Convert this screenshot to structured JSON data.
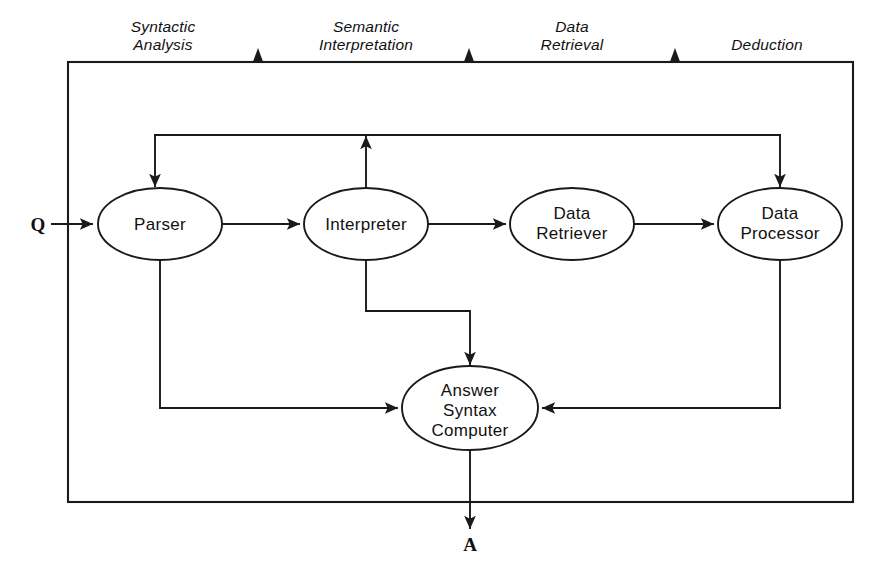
{
  "diagram": {
    "background_color": "#ffffff",
    "line_color": "#1a1a1a",
    "stage_labels": [
      {
        "id": "syntactic-analysis",
        "line1": "Syntactic",
        "line2": "Analysis",
        "x": 163,
        "label_y": 30
      },
      {
        "id": "semantic-interpretation",
        "line1": "Semantic",
        "line2": "Interpretation",
        "x": 366,
        "label_y": 30
      },
      {
        "id": "data-retrieval",
        "line1": "Data",
        "line2": "Retrieval",
        "x": 572,
        "label_y": 30
      },
      {
        "id": "deduction",
        "line1": "Deduction",
        "line2": "",
        "x": 765,
        "label_y": 48
      }
    ],
    "stage_dividers": [
      {
        "id": "divider-1",
        "x": 258
      },
      {
        "id": "divider-2",
        "x": 469
      },
      {
        "id": "divider-3",
        "x": 675
      }
    ],
    "nodes": [
      {
        "id": "parser",
        "lines": [
          "Parser"
        ],
        "cx": 160,
        "cy": 224,
        "rx": 62,
        "ry": 36
      },
      {
        "id": "interpreter",
        "lines": [
          "Interpreter"
        ],
        "cx": 366,
        "cy": 224,
        "rx": 62,
        "ry": 36
      },
      {
        "id": "data-retriever",
        "lines": [
          "Data",
          "Retriever"
        ],
        "cx": 572,
        "cy": 224,
        "rx": 62,
        "ry": 36
      },
      {
        "id": "data-processor",
        "lines": [
          "Data",
          "Processor"
        ],
        "cx": 780,
        "cy": 224,
        "rx": 62,
        "ry": 36
      },
      {
        "id": "answer-syntax-computer",
        "lines": [
          "Answer",
          "Syntax",
          "Computer"
        ],
        "cx": 470,
        "cy": 408,
        "rx": 68,
        "ry": 42
      }
    ],
    "io_labels": [
      {
        "id": "question-input",
        "text": "Q",
        "x": 38,
        "y": 230
      },
      {
        "id": "answer-output",
        "text": "A",
        "x": 470,
        "y": 548
      }
    ],
    "frame": {
      "x": 68,
      "y": 62,
      "width": 785,
      "height": 440
    },
    "edges": [
      {
        "id": "q-to-parser",
        "from": "Q",
        "to": "parser"
      },
      {
        "id": "parser-to-interpreter",
        "from": "parser",
        "to": "interpreter"
      },
      {
        "id": "interpreter-to-data-retriever",
        "from": "interpreter",
        "to": "data-retriever"
      },
      {
        "id": "data-retriever-to-data-processor",
        "from": "data-retriever",
        "to": "data-processor"
      },
      {
        "id": "interpreter-to-feedback-bus",
        "from": "interpreter",
        "to": "feedback-bus"
      },
      {
        "id": "feedback-bus-to-parser",
        "from": "feedback-bus",
        "to": "parser"
      },
      {
        "id": "feedback-bus-to-data-processor",
        "from": "feedback-bus",
        "to": "data-processor"
      },
      {
        "id": "parser-to-answer-syntax-computer",
        "from": "parser",
        "to": "answer-syntax-computer"
      },
      {
        "id": "interpreter-to-answer-syntax-computer",
        "from": "interpreter",
        "to": "answer-syntax-computer"
      },
      {
        "id": "data-processor-to-answer-syntax-computer",
        "from": "data-processor",
        "to": "answer-syntax-computer"
      },
      {
        "id": "answer-syntax-computer-to-a",
        "from": "answer-syntax-computer",
        "to": "A"
      }
    ]
  }
}
